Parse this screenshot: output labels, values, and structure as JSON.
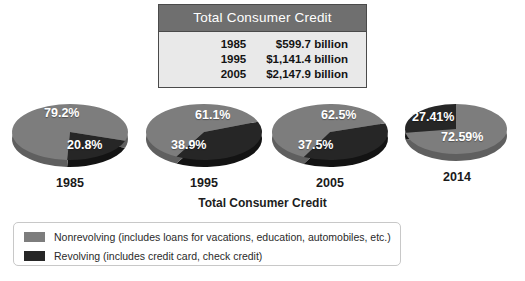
{
  "table": {
    "title": "Total Consumer Credit",
    "columns": [
      "Year",
      "Amount"
    ],
    "rows": [
      {
        "year": "1985",
        "amount": "$599.7 billion"
      },
      {
        "year": "1995",
        "amount": "$1,141.4 billion"
      },
      {
        "year": "2005",
        "amount": "$2,147.9 billion"
      }
    ]
  },
  "chart_caption": "Total Consumer Credit",
  "legend": {
    "items": [
      {
        "label": "Nonrevolving (includes loans for vacations, education, automobiles, etc.)",
        "color": "#7d7d7d"
      },
      {
        "label": "Revolving (includes credit card, check credit)",
        "color": "#262626"
      }
    ]
  },
  "colors": {
    "nonrevolving": "#7d7d7d",
    "nonrevolving_side": "#5f5f5f",
    "revolving": "#262626",
    "revolving_side": "#131313",
    "table_header_bg": "#6f6f6f",
    "table_body_bg": "#e9e9e9",
    "table_border": "#4a4a4a"
  },
  "chart_data": {
    "type": "pie",
    "title": "Total Consumer Credit",
    "legend_position": "bottom-left",
    "categories": [
      "Nonrevolving",
      "Revolving"
    ],
    "pies": [
      {
        "year": "1985",
        "nonrevolving_label": "79.2%",
        "revolving_label": "20.8%",
        "values": [
          79.2,
          20.8
        ]
      },
      {
        "year": "1995",
        "nonrevolving_label": "61.1%",
        "revolving_label": "38.9%",
        "values": [
          61.1,
          38.9
        ]
      },
      {
        "year": "2005",
        "nonrevolving_label": "62.5%",
        "revolving_label": "37.5%",
        "values": [
          62.5,
          37.5
        ]
      },
      {
        "year": "2014",
        "nonrevolving_label": "72.59%",
        "revolving_label": "27.41%",
        "values": [
          72.59,
          27.41
        ]
      }
    ],
    "table_series": {
      "name": "Total Consumer Credit",
      "x": [
        "1985",
        "1995",
        "2005"
      ],
      "values": [
        599.7,
        1141.4,
        2147.9
      ],
      "units": "billion USD"
    }
  }
}
